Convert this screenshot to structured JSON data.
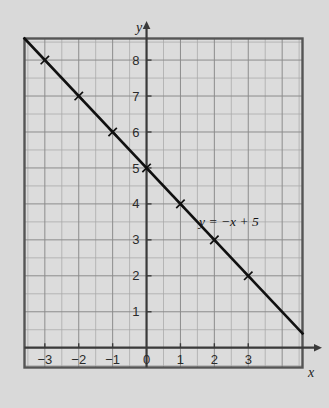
{
  "figure": {
    "background_color": "#d9d9d9",
    "plot_background_color": "#dcdcdc",
    "border_color": "#555555",
    "grid_color": "#8c8c8c",
    "grid_minor_color": "#a8a8a8",
    "axis_color": "#3a3a3a",
    "line_color": "#101010",
    "text_color": "#1d1d1d"
  },
  "chart_data": {
    "type": "line",
    "title": "",
    "xlabel": "x",
    "ylabel": "y",
    "equation": "y = −x + 5",
    "slope": -1,
    "intercept": 5,
    "xlim": [
      -3.6,
      4.6
    ],
    "ylim": [
      -0.55,
      8.6
    ],
    "grid": true,
    "grid_step": 0.5,
    "legend": "none",
    "x_tick_labels": [
      "−3",
      "−2",
      "−1",
      "0",
      "1",
      "2",
      "3"
    ],
    "x_ticks": [
      -3,
      -2,
      -1,
      0,
      1,
      2,
      3
    ],
    "y_tick_labels": [
      "1",
      "2",
      "3",
      "4",
      "5",
      "6",
      "7",
      "8"
    ],
    "y_ticks": [
      1,
      2,
      3,
      4,
      5,
      6,
      7,
      8
    ],
    "x": [
      -3,
      -2,
      -1,
      0,
      1,
      2,
      3
    ],
    "y": [
      8,
      7,
      6,
      5,
      4,
      3,
      2
    ],
    "marker": "x-cross",
    "series": [
      {
        "name": "y = −x + 5",
        "points": [
          {
            "x": -3,
            "y": 8
          },
          {
            "x": -2,
            "y": 7
          },
          {
            "x": -1,
            "y": 6
          },
          {
            "x": 0,
            "y": 5
          },
          {
            "x": 1,
            "y": 4
          },
          {
            "x": 2,
            "y": 3
          },
          {
            "x": 3,
            "y": 2
          }
        ],
        "line_extent": {
          "x_start": -3.22,
          "y_start": 8.22,
          "x_end": 4.0,
          "y_end": 1.0
        }
      }
    ],
    "annotations": [
      {
        "text": "y = −x + 5",
        "x": 1.55,
        "y": 3.38
      }
    ]
  }
}
